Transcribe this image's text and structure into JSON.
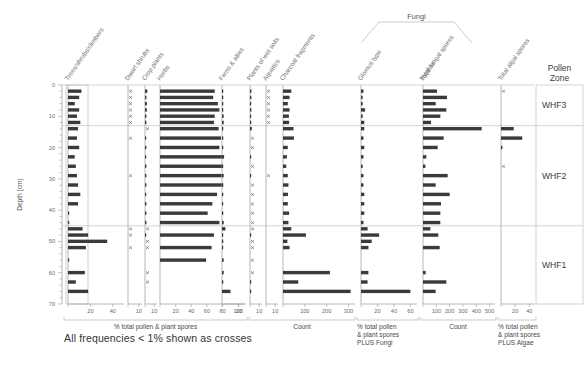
{
  "figure": {
    "depth_axis_label": "Depth (cm)",
    "depth_ticks": [
      0,
      10,
      20,
      30,
      40,
      50,
      60,
      70
    ],
    "depth_min": 0,
    "depth_max": 70,
    "zone_header": "Pollen\nZone",
    "zone_header_line1": "Pollen",
    "zone_header_line2": "Zone",
    "footnote": "All frequencies < 1% shown as crosses",
    "group_label_fungi": "Fungi",
    "bar_color": "#3a3a3a"
  },
  "axis_groups": [
    {
      "name": "pollen-plant-spores",
      "label": "% total pollen & plant spores",
      "x0": 64,
      "x1": 247
    },
    {
      "name": "charcoal-count",
      "label": "Count",
      "x0": 249,
      "x1": 355
    },
    {
      "name": "pollen-plus-fungi",
      "label": "% total pollen\n& plant spores\nPLUS Fungi",
      "label_lines": [
        "% total pollen",
        "& plant spores",
        "PLUS Fungi"
      ],
      "x0": 357,
      "x1": 418
    },
    {
      "name": "hyphae-count",
      "label": "Count",
      "x0": 420,
      "x1": 496
    },
    {
      "name": "pollen-plus-algae",
      "label": "% total pollen\n& plant spores\nPLUS Algae",
      "label_lines": [
        "% total pollen",
        "& plant spores",
        "PLUS Algae"
      ],
      "x0": 498,
      "x1": 536
    }
  ],
  "zones": [
    {
      "label": "WHF3",
      "top_depth": 0,
      "bottom_depth": 13
    },
    {
      "label": "WHF2",
      "top_depth": 13,
      "bottom_depth": 45
    },
    {
      "label": "WHF1",
      "top_depth": 45,
      "bottom_depth": 70
    }
  ],
  "depths": [
    2,
    4,
    6,
    8,
    10,
    12,
    14,
    17,
    20,
    23,
    26,
    29,
    32,
    35,
    38,
    41,
    44,
    46,
    48,
    50,
    52,
    56,
    60,
    63,
    66
  ],
  "chart_data": {
    "type": "bar",
    "title": "",
    "xlabel": "% total pollen & plant spores",
    "ylabel": "Depth (cm)",
    "ylim": [
      0,
      70
    ],
    "grid": false,
    "legend": "none",
    "orientation": "horizontal-strat",
    "curves": [
      {
        "name": "Trees/shrubs/climbers",
        "label": "Trees/shrubs/climbers",
        "unit": "percent",
        "axis_group": "pollen-plant-spores",
        "x": 68,
        "width": 56,
        "max": 50,
        "ticks": [
          20,
          40
        ],
        "values": [
          12,
          10,
          6,
          10,
          8,
          11,
          9,
          8,
          10,
          6,
          7,
          8,
          9,
          11,
          9,
          1,
          1,
          13,
          18,
          35,
          16,
          1,
          15,
          7,
          18
        ]
      },
      {
        "name": "Dwarf shrubs",
        "label": "Dwarf shrubs",
        "unit": "percent",
        "axis_group": "pollen-plant-spores",
        "x": 128,
        "width": 14,
        "max": 13,
        "ticks": [
          10
        ],
        "values": [
          0.4,
          0.4,
          0.4,
          0.4,
          0.4,
          0.4,
          0,
          0.4,
          0,
          0,
          0,
          0.4,
          0,
          0,
          0,
          0,
          0,
          0.4,
          0.4,
          0,
          0.4,
          0,
          0,
          0,
          0
        ]
      },
      {
        "name": "Crop plants",
        "label": "Crop plants",
        "unit": "percent",
        "axis_group": "pollen-plant-spores",
        "x": 145,
        "width": 12,
        "max": 13,
        "ticks": [
          10
        ],
        "values": [
          2.5,
          1.5,
          2,
          2,
          1.5,
          1.5,
          0.5,
          1,
          1.5,
          1,
          1.5,
          1.5,
          1.5,
          1,
          1.5,
          1.5,
          1.5,
          0.4,
          1,
          0.4,
          0.4,
          0,
          0.4,
          0.4,
          0
        ]
      },
      {
        "name": "Herbs",
        "label": "Herbs",
        "unit": "percent",
        "axis_group": "pollen-plant-spores",
        "x": 160,
        "width": 86,
        "max": 110,
        "ticks": [
          20,
          40,
          60,
          80,
          100
        ],
        "values": [
          70,
          68,
          74,
          76,
          70,
          69,
          75,
          78,
          76,
          82,
          80,
          79,
          80,
          73,
          67,
          61,
          76,
          0,
          69,
          0,
          66,
          59,
          0,
          0,
          0
        ]
      },
      {
        "name": "Ferns & allies",
        "label": "Ferns & allies",
        "unit": "percent",
        "axis_group": "pollen-plant-spores",
        "x": 222,
        "width": 22,
        "max": 26,
        "ticks": [
          20
        ],
        "values": [
          1.5,
          1.5,
          1.5,
          1.5,
          2,
          2,
          1.5,
          1.5,
          1.5,
          1,
          1,
          2,
          1.5,
          1.5,
          1,
          1.5,
          2,
          4,
          1,
          1.5,
          1,
          2,
          2,
          1.5,
          10
        ]
      },
      {
        "name": "Plants of wet soils",
        "label": "Plants of wet soils",
        "unit": "percent",
        "axis_group": "pollen-plant-spores",
        "x": 250,
        "width": 12,
        "max": 13,
        "ticks": [
          10
        ],
        "values": [
          1.5,
          1.5,
          1,
          1.5,
          1,
          1,
          2,
          0.4,
          0.4,
          1,
          0.4,
          1,
          0.4,
          0.4,
          0.4,
          0.4,
          0.4,
          0.4,
          1,
          0.4,
          0.4,
          0.4,
          0.4,
          1,
          1
        ]
      },
      {
        "name": "Aquatics",
        "label": "Aquatics",
        "unit": "percent",
        "axis_group": "pollen-plant-spores",
        "x": 266,
        "width": 12,
        "max": 13,
        "ticks": [
          10
        ],
        "values": [
          0.4,
          0.4,
          0.4,
          0.4,
          0.4,
          0.4,
          0,
          0,
          0,
          0,
          0,
          0.4,
          0,
          0,
          0,
          0,
          0,
          0,
          0,
          0,
          0,
          0,
          0,
          0,
          0
        ]
      },
      {
        "name": "Charcoal fragments",
        "label": "Charcoal fragments",
        "unit": "count",
        "axis_group": "charcoal-count",
        "x": 283,
        "width": 72,
        "max": 330,
        "ticks": [
          100,
          200,
          300
        ],
        "values": [
          38,
          30,
          22,
          30,
          27,
          28,
          48,
          50,
          22,
          18,
          15,
          22,
          25,
          23,
          22,
          28,
          25,
          38,
          105,
          20,
          30,
          0,
          215,
          70,
          310
        ]
      },
      {
        "name": "Glomus type",
        "label": "Glomus type",
        "unit": "percent",
        "axis_group": "pollen-plus-fungi",
        "x": 361,
        "width": 56,
        "max": 68,
        "ticks": [
          20,
          40,
          60
        ],
        "values": [
          3,
          2,
          2,
          5,
          2,
          4,
          4,
          3,
          4,
          3,
          2,
          3,
          3,
          4,
          4,
          4,
          3,
          8,
          22,
          13,
          9,
          0,
          9,
          8,
          60
        ]
      },
      {
        "name": "Total fungal spores",
        "label": "Total fungal spores",
        "unit": "count",
        "axis_group": "hyphae-count",
        "x": 423,
        "width": 72,
        "max": 540,
        "ticks": [
          100,
          200,
          300,
          400,
          500
        ],
        "values": [
          105,
          180,
          95,
          175,
          130,
          60,
          440,
          155,
          110,
          25,
          18,
          185,
          95,
          200,
          135,
          130,
          130,
          55,
          115,
          0,
          125,
          0,
          20,
          175,
          95
        ]
      },
      {
        "name": "Hyphae",
        "label": "Hyphae",
        "unit": "count",
        "axis_group": "hyphae-count",
        "x": 423,
        "width": 72,
        "max": 540,
        "ticks": [
          100,
          200,
          300,
          400,
          500
        ]
      },
      {
        "name": "Total algal spores",
        "label": "Total algal spores",
        "unit": "percent",
        "axis_group": "pollen-plus-algae",
        "x": 501,
        "width": 34,
        "max": 48,
        "ticks": [
          20,
          40
        ],
        "values": [
          0.4,
          0,
          0,
          0,
          0,
          0,
          18,
          30,
          2,
          0,
          0.4,
          0,
          0,
          0,
          0,
          0,
          0,
          0,
          0,
          0,
          0,
          0,
          0,
          0,
          0
        ]
      }
    ]
  }
}
